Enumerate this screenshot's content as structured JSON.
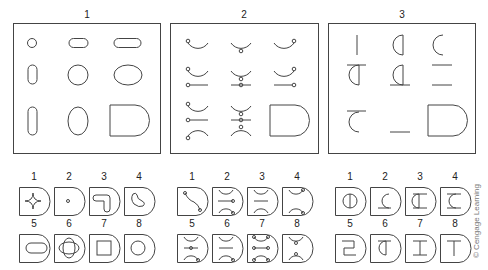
{
  "figure": {
    "big_panels": [
      {
        "label": "1",
        "x": 13,
        "y": 23,
        "w": 147,
        "h": 130
      },
      {
        "label": "2",
        "x": 170,
        "y": 23,
        "w": 148,
        "h": 130
      },
      {
        "label": "3",
        "x": 328,
        "y": 23,
        "w": 147,
        "h": 130
      }
    ],
    "small_groups": [
      {
        "labels": [
          "1",
          "2",
          "3",
          "4",
          "5",
          "6",
          "7",
          "8"
        ]
      },
      {
        "labels": [
          "1",
          "2",
          "3",
          "4",
          "5",
          "6",
          "7",
          "8"
        ]
      },
      {
        "labels": [
          "1",
          "2",
          "3",
          "4",
          "5",
          "6",
          "7",
          "8"
        ]
      }
    ],
    "credit": "© Cengage Learning",
    "stroke_color": "#444444"
  }
}
